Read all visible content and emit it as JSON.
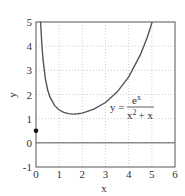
{
  "chart_data": {
    "type": "line",
    "title": "",
    "xlabel": "x",
    "ylabel": "y",
    "xlim": [
      0,
      6
    ],
    "ylim": [
      -1,
      5
    ],
    "grid": true,
    "x_ticks": [
      "0",
      "1",
      "2",
      "3",
      "4",
      "5",
      "6"
    ],
    "y_ticks": [
      "-1",
      "0",
      "1",
      "2",
      "3",
      "4",
      "5"
    ],
    "annotation": {
      "lhs": "y =",
      "numerator": "e",
      "numerator_exp": "x",
      "denominator_base": "x",
      "denominator_exp": "2",
      "denominator_rest": "+ x"
    },
    "series": [
      {
        "name": "y = e^x / (x^2 + x)",
        "x": [
          0.2,
          0.25,
          0.3,
          0.4,
          0.5,
          0.6,
          0.8,
          1.0,
          1.2,
          1.4,
          1.6,
          1.8,
          2.0,
          2.5,
          3.0,
          3.5,
          4.0,
          4.5,
          4.8,
          5.0
        ],
        "y": [
          5.09,
          4.11,
          3.46,
          2.66,
          2.2,
          1.9,
          1.55,
          1.36,
          1.26,
          1.21,
          1.19,
          1.2,
          1.23,
          1.39,
          1.67,
          2.1,
          2.73,
          3.64,
          4.36,
          4.95
        ]
      }
    ],
    "horizontal_line": {
      "y": 0
    },
    "marked_point": {
      "x": 0,
      "y": 0.5
    }
  }
}
